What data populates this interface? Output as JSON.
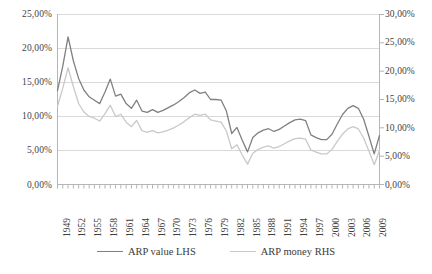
{
  "chart_data": {
    "type": "line",
    "title": "",
    "xlabel": "",
    "ylabel": "",
    "y_left_label": "ARP value LHS",
    "y_right_label": "ARP money RHS",
    "ylim": [
      0,
      25
    ],
    "ylim_right": [
      0,
      30
    ],
    "grid": true,
    "legend_position": "bottom",
    "y_left_ticks": [
      "0,00%",
      "5,00%",
      "10,00%",
      "15,00%",
      "20,00%",
      "25,00%"
    ],
    "y_right_ticks": [
      "0,00%",
      "5,00%",
      "10,00%",
      "15,00%",
      "20,00%",
      "25,00%",
      "30,00%"
    ],
    "x_tick_labels": [
      "1949",
      "1952",
      "1955",
      "1958",
      "1961",
      "1964",
      "1967",
      "1970",
      "1973",
      "1976",
      "1979",
      "1982",
      "1985",
      "1988",
      "1991",
      "1994",
      "1997",
      "2000",
      "2003",
      "2006",
      "2009"
    ],
    "x": [
      1949,
      1950,
      1951,
      1952,
      1953,
      1954,
      1955,
      1956,
      1957,
      1958,
      1959,
      1960,
      1961,
      1962,
      1963,
      1964,
      1965,
      1966,
      1967,
      1968,
      1969,
      1970,
      1971,
      1972,
      1973,
      1974,
      1975,
      1976,
      1977,
      1978,
      1979,
      1980,
      1981,
      1982,
      1983,
      1984,
      1985,
      1986,
      1987,
      1988,
      1989,
      1990,
      1991,
      1992,
      1993,
      1994,
      1995,
      1996,
      1997,
      1998,
      1999,
      2000,
      2001,
      2002,
      2003,
      2004,
      2005,
      2006,
      2007,
      2008,
      2009,
      2010
    ],
    "series": [
      {
        "name": "ARP value LHS",
        "axis": "left",
        "color": "#808080",
        "values": [
          13.8,
          17.4,
          21.7,
          18.2,
          15.6,
          13.9,
          12.9,
          12.4,
          11.9,
          13.6,
          15.5,
          13.0,
          13.3,
          11.9,
          11.2,
          12.4,
          10.8,
          10.6,
          11.0,
          10.6,
          10.9,
          11.3,
          11.7,
          12.2,
          12.8,
          13.5,
          13.9,
          13.4,
          13.6,
          12.5,
          12.5,
          12.4,
          10.8,
          7.5,
          8.4,
          6.5,
          4.8,
          6.9,
          7.6,
          8.0,
          8.2,
          7.8,
          8.1,
          8.6,
          9.1,
          9.5,
          9.6,
          9.4,
          7.3,
          6.9,
          6.6,
          6.6,
          7.4,
          8.9,
          10.3,
          11.2,
          11.6,
          11.2,
          9.6,
          7.1,
          4.5,
          7.2
        ]
      },
      {
        "name": "ARP money RHS",
        "axis": "right",
        "color": "#c9c9c9",
        "values": [
          13.8,
          17.0,
          20.6,
          17.3,
          14.3,
          12.8,
          12.0,
          11.7,
          11.2,
          12.5,
          14.0,
          12.0,
          12.4,
          11.0,
          10.2,
          11.3,
          9.5,
          9.2,
          9.5,
          9.1,
          9.3,
          9.6,
          10.0,
          10.5,
          11.1,
          11.8,
          12.4,
          12.2,
          12.4,
          11.4,
          11.2,
          11.0,
          9.4,
          6.3,
          7.0,
          5.2,
          3.6,
          5.5,
          6.2,
          6.6,
          6.8,
          6.4,
          6.7,
          7.2,
          7.7,
          8.1,
          8.2,
          8.0,
          6.1,
          5.7,
          5.4,
          5.4,
          6.2,
          7.6,
          8.9,
          9.8,
          10.2,
          9.8,
          8.2,
          5.9,
          3.5,
          6.0
        ]
      }
    ]
  },
  "legend": {
    "items": [
      {
        "label": "ARP value LHS",
        "color": "#808080"
      },
      {
        "label": "ARP money RHS",
        "color": "#c9c9c9"
      }
    ]
  },
  "colors": {
    "series_dark": "#808080",
    "series_light": "#c9c9c9",
    "gridline": "#d9d9d9",
    "axis": "#b5b5b5",
    "text": "#3b3b3b"
  }
}
